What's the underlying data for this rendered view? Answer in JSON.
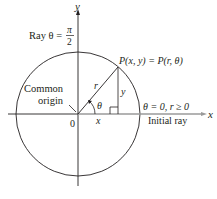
{
  "diagram": {
    "axes": {
      "x_label": "x",
      "y_label": "y",
      "origin_label": "0"
    },
    "labels": {
      "ray_prefix": "Ray θ =",
      "ray_fraction_num": "π",
      "ray_fraction_den": "2",
      "common": "Common",
      "origin": "origin",
      "point": "P(x, y) = P(r, θ)",
      "r": "r",
      "y_leg": "y",
      "x_leg": "x",
      "theta": "θ",
      "initial_condition": "θ = 0, r ≥ 0",
      "initial_ray": "Initial ray"
    },
    "colors": {
      "ink": "#231f20",
      "axis": "#231f20",
      "ray_highlight": "#c8c8c8"
    }
  }
}
